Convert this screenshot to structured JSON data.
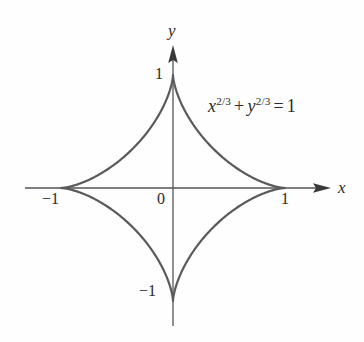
{
  "figure": {
    "kind": "astroid-plot",
    "background_color": "#fefefe",
    "curve_color": "#5a5a5a",
    "axis_color": "#555555",
    "text_color": "#2a2a2a"
  },
  "axes": {
    "x_label": "x",
    "y_label": "y",
    "origin_label": "0",
    "x_ticks": [
      {
        "label": "−1",
        "value": -1
      },
      {
        "label": "1",
        "value": 1
      }
    ],
    "y_ticks": [
      {
        "label": "1",
        "value": 1
      },
      {
        "label": "−1",
        "value": -1
      }
    ]
  },
  "equation": {
    "full_text": "x^{2/3} + y^{2/3} = 1",
    "lhs_var_1": "x",
    "lhs_exp_1": "2/3",
    "plus": "+",
    "lhs_var_2": "y",
    "lhs_exp_2": "2/3",
    "equals": "=",
    "rhs": "1"
  },
  "chart_data": {
    "type": "line",
    "title": "",
    "xlabel": "x",
    "ylabel": "y",
    "equation": "x^(2/3) + y^(2/3) = 1",
    "curve_name": "astroid",
    "grid": false,
    "legend": "none",
    "xlim": [
      -1.32,
      1.4
    ],
    "ylim": [
      -1.22,
      1.27
    ],
    "xticks": [
      -1,
      0,
      1
    ],
    "xticklabels": [
      "−1",
      "0",
      "1"
    ],
    "yticks": [
      -1,
      1
    ],
    "yticklabels": [
      "−1",
      "1"
    ],
    "parametric": {
      "x": "cos(t)^3",
      "y": "sin(t)^3",
      "t_range": [
        0,
        6.283185307179586
      ]
    },
    "cusps": [
      {
        "x": 1,
        "y": 0
      },
      {
        "x": 0,
        "y": 1
      },
      {
        "x": -1,
        "y": 0
      },
      {
        "x": 0,
        "y": -1
      }
    ],
    "points": [
      {
        "x": 1.0,
        "y": 0.0
      },
      {
        "x": 0.984,
        "y": 0.0007
      },
      {
        "x": 0.937,
        "y": 0.0059
      },
      {
        "x": 0.861,
        "y": 0.0194
      },
      {
        "x": 0.76,
        "y": 0.0442
      },
      {
        "x": 0.642,
        "y": 0.0826
      },
      {
        "x": 0.513,
        "y": 0.1356
      },
      {
        "x": 0.383,
        "y": 0.2029
      },
      {
        "x": 0.259,
        "y": 0.2829
      },
      {
        "x": 0.149,
        "y": 0.3727
      },
      {
        "x": 0.0607,
        "y": 0.4688
      },
      {
        "x": 0.0,
        "y": 0.5
      },
      {
        "x": -0.0607,
        "y": 0.4688
      },
      {
        "x": -0.149,
        "y": 0.3727
      },
      {
        "x": -0.259,
        "y": 0.2829
      },
      {
        "x": -0.383,
        "y": 0.2029
      },
      {
        "x": -0.513,
        "y": 0.1356
      },
      {
        "x": -0.642,
        "y": 0.0826
      },
      {
        "x": -0.76,
        "y": 0.0442
      },
      {
        "x": -0.861,
        "y": 0.0194
      },
      {
        "x": -0.937,
        "y": 0.0059
      },
      {
        "x": -1.0,
        "y": 0.0
      }
    ]
  }
}
